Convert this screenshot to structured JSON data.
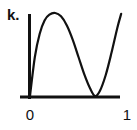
{
  "chart_data": {
    "type": "line",
    "panel_label": "k.",
    "title": "",
    "xlabel": "",
    "ylabel": "",
    "xlim": [
      0,
      1
    ],
    "ylim": [
      0,
      1
    ],
    "grid": false,
    "legend": "none",
    "x_ticks": [
      {
        "value": 0,
        "label": "0"
      },
      {
        "value": 1,
        "label": "1"
      }
    ],
    "series": [
      {
        "name": "curve",
        "color": "#111111",
        "description": "rises from 0 to a maximum near x=0.26, falls to touch 0 near x=0.67, rises again toward x=0.94",
        "x": [
          0,
          0.05,
          0.1,
          0.15,
          0.2,
          0.26,
          0.32,
          0.38,
          0.44,
          0.5,
          0.56,
          0.62,
          0.67,
          0.72,
          0.78,
          0.84,
          0.9,
          0.94
        ],
        "y": [
          0,
          0.47,
          0.75,
          0.91,
          0.98,
          1.0,
          0.96,
          0.85,
          0.68,
          0.47,
          0.26,
          0.09,
          0.0,
          0.06,
          0.25,
          0.52,
          0.82,
          0.99
        ]
      }
    ]
  }
}
